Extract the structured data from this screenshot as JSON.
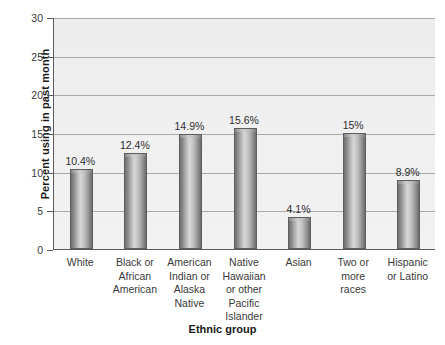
{
  "chart_data": {
    "type": "bar",
    "title": "",
    "xlabel": "Ethnic group",
    "ylabel": "Percent using in past month",
    "categories": [
      "White",
      "Black or African American",
      "American Indian or Alaska Native",
      "Native Hawaiian or other Pacific Islander",
      "Asian",
      "Two or more races",
      "Hispanic or Latino"
    ],
    "category_lines": [
      [
        "White"
      ],
      [
        "Black or",
        "African",
        "American"
      ],
      [
        "American",
        "Indian or",
        "Alaska",
        "Native"
      ],
      [
        "Native",
        "Hawaiian",
        "or other",
        "Pacific",
        "Islander"
      ],
      [
        "Asian"
      ],
      [
        "Two or",
        "more",
        "races"
      ],
      [
        "Hispanic",
        "or Latino"
      ]
    ],
    "values": [
      10.4,
      12.4,
      14.9,
      15.6,
      4.1,
      15,
      8.9
    ],
    "value_labels": [
      "10.4%",
      "12.4%",
      "14.9%",
      "15.6%",
      "4.1%",
      "15%",
      "8.9%"
    ],
    "ylim": [
      0,
      30
    ],
    "ytick_labels": [
      "30",
      "25",
      "20",
      "15",
      "10",
      "5",
      "0"
    ],
    "ytick_values": [
      30,
      25,
      20,
      15,
      10,
      5,
      0
    ],
    "grid": true,
    "legend": "none",
    "colors": {
      "bar_dark": "#6f6f6f",
      "bar_light": "#d7d7d7",
      "plot_background": "#efefef",
      "gridline": "#a9a9a9",
      "axis": "#5a5a5a",
      "text": "#2e2e2e"
    }
  }
}
